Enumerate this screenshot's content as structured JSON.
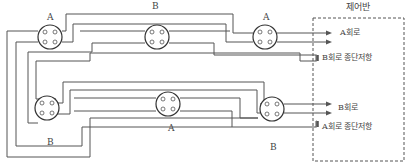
{
  "diagram": {
    "panel": {
      "title": "제어반"
    },
    "top_row": {
      "labels": {
        "left_connector": "A",
        "middle_wire": "B",
        "right_connector": "A"
      },
      "outputs": [
        {
          "label": "A회로",
          "type": "arrow-pair"
        },
        {
          "label": "B회로 종단저항",
          "type": "resistor"
        }
      ]
    },
    "bottom_row": {
      "labels": {
        "left_connector": "B",
        "middle_connector": "A",
        "right_wire": "B"
      },
      "outputs": [
        {
          "label": "B회로",
          "type": "arrow-pair"
        },
        {
          "label": "A회로 종단저항",
          "type": "resistor"
        }
      ]
    },
    "colors": {
      "line": "#555555",
      "background": "#ffffff",
      "text": "#444444"
    }
  }
}
